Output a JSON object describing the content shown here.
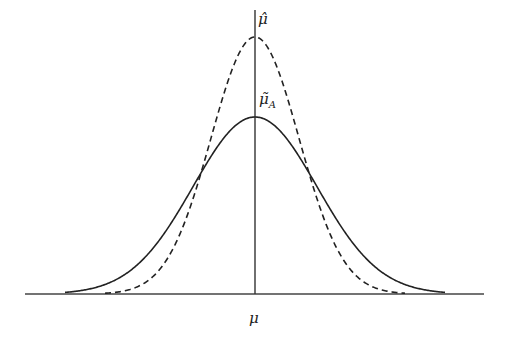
{
  "figure": {
    "type": "diagram",
    "labels": {
      "mu_hat": "μ̂",
      "mu_tilde": "μ̃",
      "mu_tilde_sub": "A",
      "mu": "μ"
    },
    "curves": [
      {
        "name": "mu-hat-density",
        "style": "dashed",
        "center_px": 255,
        "peak_height_px": 257,
        "sigma_px": 44
      },
      {
        "name": "mu-tilde-A-density",
        "style": "solid",
        "center_px": 255,
        "peak_height_px": 177,
        "sigma_px": 62
      }
    ],
    "axes": {
      "baseline_y": 294,
      "baseline_x_start": 25,
      "baseline_x_end": 484,
      "vertical_x": 255,
      "vertical_y_top": 10
    },
    "colors": {
      "line": "#222222",
      "background": "#ffffff"
    }
  }
}
